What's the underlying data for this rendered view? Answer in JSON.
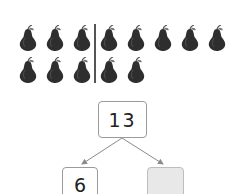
{
  "pears": {
    "row1": [
      {
        "x": 18,
        "y": 25
      },
      {
        "x": 45,
        "y": 25
      },
      {
        "x": 72,
        "y": 25
      },
      {
        "x": 99,
        "y": 25
      },
      {
        "x": 126,
        "y": 25
      },
      {
        "x": 153,
        "y": 25
      },
      {
        "x": 180,
        "y": 25
      },
      {
        "x": 207,
        "y": 25
      }
    ],
    "row2": [
      {
        "x": 18,
        "y": 57
      },
      {
        "x": 45,
        "y": 57
      },
      {
        "x": 72,
        "y": 57
      },
      {
        "x": 99,
        "y": 57
      },
      {
        "x": 126,
        "y": 57
      }
    ],
    "count_total": 13,
    "count_left_of_divider": 6,
    "count_right_of_divider": 7
  },
  "number_bond": {
    "whole": "13",
    "part_known": "6",
    "part_unknown": ""
  },
  "colors": {
    "pear": "#2e2e2e",
    "divider": "#555555",
    "arrow": "#8a8a8a",
    "unknown_box_fill": "#e8e8e8"
  }
}
